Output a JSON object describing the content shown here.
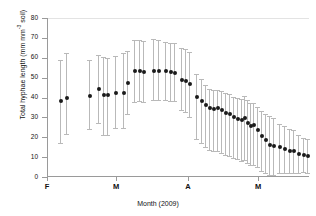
{
  "chart_data": {
    "type": "scatter",
    "title": "",
    "xlabel": "Month (2009)",
    "ylabel": "Total hyphae length (mm mm⁻³ soil)",
    "ylabel_main": "Total hyphae length (mm mm",
    "ylabel_sup": "-3",
    "ylabel_tail": " soil)",
    "ylim": [
      0,
      80
    ],
    "yticks": [
      0,
      10,
      20,
      30,
      40,
      50,
      60,
      70,
      80
    ],
    "xticks_labels": [
      "F",
      "M",
      "A",
      "M"
    ],
    "xticks_positions": [
      47,
      116,
      188,
      258
    ],
    "xlim_px": [
      47,
      309
    ],
    "grid": false,
    "legend": null,
    "marker": "filled-circle",
    "marker_color": "#1a1a1a",
    "errorbar_color": "#b9b9b9",
    "errorbar_style": "capped-vertical",
    "series": [
      {
        "name": "Total hyphae length",
        "points": [
          {
            "x": 60,
            "y": 38.0,
            "lo": 17.0,
            "hi": 59.0
          },
          {
            "x": 66,
            "y": 40.0,
            "lo": 21.5,
            "hi": 62.5
          },
          {
            "x": 89,
            "y": 41.0,
            "lo": 24.0,
            "hi": 59.0
          },
          {
            "x": 98,
            "y": 44.5,
            "lo": 27.0,
            "hi": 61.5
          },
          {
            "x": 103,
            "y": 41.5,
            "lo": 21.0,
            "hi": 60.5
          },
          {
            "x": 107,
            "y": 41.5,
            "lo": 21.0,
            "hi": 60.0
          },
          {
            "x": 115,
            "y": 42.5,
            "lo": 24.5,
            "hi": 61.0
          },
          {
            "x": 123,
            "y": 42.5,
            "lo": 24.5,
            "hi": 62.5
          },
          {
            "x": 127,
            "y": 47.5,
            "lo": 31.5,
            "hi": 63.5
          },
          {
            "x": 134,
            "y": 53.5,
            "lo": 37.5,
            "hi": 69.0
          },
          {
            "x": 139,
            "y": 53.5,
            "lo": 38.0,
            "hi": 69.0
          },
          {
            "x": 143,
            "y": 53.0,
            "lo": 37.5,
            "hi": 68.5
          },
          {
            "x": 153,
            "y": 53.5,
            "lo": 38.5,
            "hi": 69.5
          },
          {
            "x": 158,
            "y": 53.5,
            "lo": 38.5,
            "hi": 69.0
          },
          {
            "x": 165,
            "y": 53.5,
            "lo": 38.5,
            "hi": 68.0
          },
          {
            "x": 170,
            "y": 53.0,
            "lo": 38.0,
            "hi": 67.5
          },
          {
            "x": 174,
            "y": 52.5,
            "lo": 38.0,
            "hi": 67.5
          },
          {
            "x": 181,
            "y": 49.0,
            "lo": 33.5,
            "hi": 65.0
          },
          {
            "x": 185,
            "y": 48.5,
            "lo": 32.5,
            "hi": 64.5
          },
          {
            "x": 189,
            "y": 47.0,
            "lo": 30.0,
            "hi": 63.0
          },
          {
            "x": 196,
            "y": 40.5,
            "lo": 19.0,
            "hi": 52.0
          },
          {
            "x": 201,
            "y": 38.0,
            "lo": 17.0,
            "hi": 49.5
          },
          {
            "x": 205,
            "y": 36.0,
            "lo": 15.0,
            "hi": 46.5
          },
          {
            "x": 209,
            "y": 34.5,
            "lo": 13.5,
            "hi": 44.5
          },
          {
            "x": 213,
            "y": 34.0,
            "lo": 13.0,
            "hi": 44.0
          },
          {
            "x": 217,
            "y": 34.5,
            "lo": 13.0,
            "hi": 44.0
          },
          {
            "x": 221,
            "y": 33.5,
            "lo": 12.0,
            "hi": 43.5
          },
          {
            "x": 225,
            "y": 32.0,
            "lo": 11.0,
            "hi": 42.5
          },
          {
            "x": 229,
            "y": 31.5,
            "lo": 10.5,
            "hi": 42.0
          },
          {
            "x": 233,
            "y": 30.0,
            "lo": 9.5,
            "hi": 40.5
          },
          {
            "x": 237,
            "y": 29.0,
            "lo": 9.0,
            "hi": 39.5
          },
          {
            "x": 241,
            "y": 28.5,
            "lo": 8.0,
            "hi": 39.0
          },
          {
            "x": 244,
            "y": 29.5,
            "lo": 8.5,
            "hi": 41.0
          },
          {
            "x": 247,
            "y": 27.0,
            "lo": 7.0,
            "hi": 38.5
          },
          {
            "x": 250,
            "y": 25.5,
            "lo": 6.0,
            "hi": 37.0
          },
          {
            "x": 253,
            "y": 26.0,
            "lo": 6.0,
            "hi": 37.0
          },
          {
            "x": 257,
            "y": 23.5,
            "lo": 5.0,
            "hi": 35.0
          },
          {
            "x": 261,
            "y": 20.5,
            "lo": 3.0,
            "hi": 33.0
          },
          {
            "x": 265,
            "y": 18.5,
            "lo": 2.0,
            "hi": 31.5
          },
          {
            "x": 269,
            "y": 16.0,
            "lo": 1.0,
            "hi": 30.5
          },
          {
            "x": 273,
            "y": 15.5,
            "lo": 1.0,
            "hi": 29.5
          },
          {
            "x": 279,
            "y": 15.0,
            "lo": 2.0,
            "hi": 26.5
          },
          {
            "x": 284,
            "y": 14.0,
            "lo": 2.0,
            "hi": 25.5
          },
          {
            "x": 289,
            "y": 13.0,
            "lo": 2.0,
            "hi": 24.0
          },
          {
            "x": 293,
            "y": 13.0,
            "lo": 2.0,
            "hi": 23.5
          },
          {
            "x": 298,
            "y": 11.5,
            "lo": 2.0,
            "hi": 21.0
          },
          {
            "x": 303,
            "y": 11.0,
            "lo": 2.5,
            "hi": 19.5
          },
          {
            "x": 307,
            "y": 10.5,
            "lo": 2.0,
            "hi": 19.0
          }
        ]
      }
    ]
  },
  "axes": {
    "y_title_prefix": "Total hyphae length (mm mm",
    "y_title_sup": "-3",
    "y_title_suffix": " soil)",
    "x_title": "Month (2009)",
    "y_tick_labels": [
      "80",
      "70",
      "60",
      "50",
      "40",
      "30",
      "20",
      "10",
      "0"
    ],
    "x_tick_labels": [
      "F",
      "M",
      "A",
      "M"
    ]
  }
}
